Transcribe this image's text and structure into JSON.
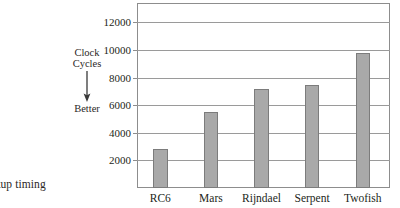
{
  "caption": {
    "fragment_text": "etup timing"
  },
  "axis_annotation": {
    "line1": "Clock",
    "line2": "Cycles",
    "arrow_icon": "arrow-down-icon",
    "better_label": "Better"
  },
  "chart_data": {
    "type": "bar",
    "title": "",
    "subtitle": "",
    "xlabel": "",
    "ylabel": "Clock Cycles",
    "categories": [
      "RC6",
      "Mars",
      "Rijndael",
      "Serpent",
      "Twofish"
    ],
    "values": [
      2800,
      5500,
      7200,
      7500,
      9800
    ],
    "series": [
      {
        "name": "Clock Cycles",
        "values": [
          2800,
          5500,
          7200,
          7500,
          9800
        ]
      }
    ],
    "ylim": [
      0,
      13400
    ],
    "yticks": [
      2000,
      4000,
      6000,
      8000,
      10000,
      12000
    ],
    "ytick_labels": [
      "2000",
      "4000",
      "6000",
      "8000",
      "10000",
      "12000"
    ],
    "grid": true,
    "grid_axis": "y",
    "legend": false,
    "legend_position": "none",
    "annotations": [
      "Clock Cycles",
      "Better"
    ],
    "bar_color": "#a9a9a9",
    "bar_edge_color": "#7c7c7c",
    "grid_color": "#9a9a9a",
    "frame_color": "#8d8d8d",
    "background": "#ffffff"
  }
}
